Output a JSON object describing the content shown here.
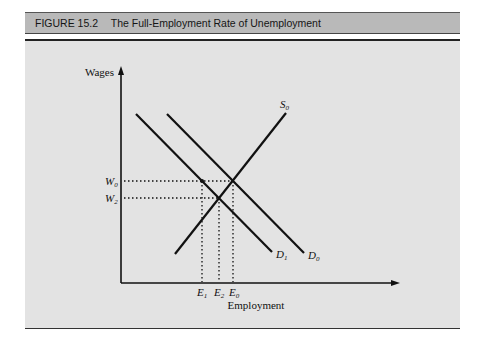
{
  "figure": {
    "number": "FIGURE 15.2",
    "title": "The Full-Employment Rate of Unemployment"
  },
  "axes": {
    "y_label": "Wages",
    "x_label": "Employment"
  },
  "curves": {
    "supply": {
      "label": "S",
      "sub": "0"
    },
    "demand0": {
      "label": "D",
      "sub": "0"
    },
    "demand1": {
      "label": "D",
      "sub": "1"
    }
  },
  "wage_levels": [
    {
      "label": "W",
      "sub": "0"
    },
    {
      "label": "W",
      "sub": "2"
    }
  ],
  "employment_levels": [
    {
      "label": "E",
      "sub": "1"
    },
    {
      "label": "E",
      "sub": "2"
    },
    {
      "label": "E",
      "sub": "0"
    }
  ],
  "colors": {
    "panel": "#e3e3e3",
    "header": "#b9b9b9",
    "ink": "#111111"
  }
}
